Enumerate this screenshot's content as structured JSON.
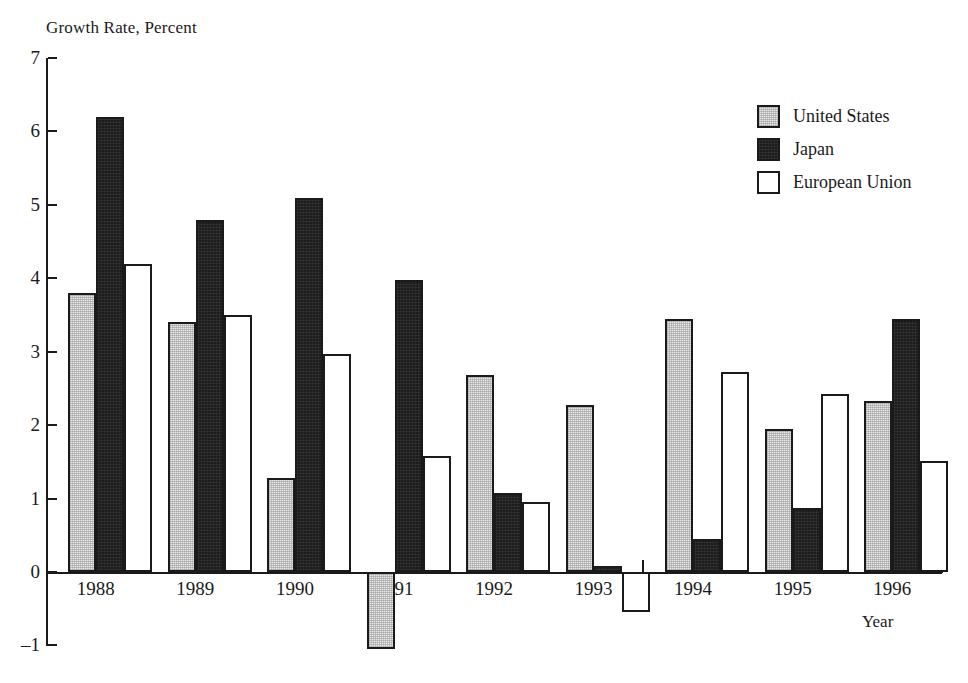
{
  "chart_data": {
    "type": "bar",
    "title": "",
    "ylabel": "Growth Rate, Percent",
    "xlabel": "Year",
    "categories": [
      "1988",
      "1989",
      "1990",
      "1991",
      "1992",
      "1993",
      "1994",
      "1995",
      "1996"
    ],
    "series": [
      {
        "name": "United States",
        "color": "#e8e8e8",
        "values": [
          3.8,
          3.4,
          1.28,
          -1.05,
          2.68,
          2.27,
          3.45,
          1.95,
          2.33
        ]
      },
      {
        "name": "Japan",
        "color": "#1c1c1c",
        "values": [
          6.2,
          4.8,
          5.1,
          3.98,
          1.07,
          0.08,
          0.45,
          0.87,
          3.45
        ]
      },
      {
        "name": "European Union",
        "color": "#ffffff",
        "values": [
          4.2,
          3.5,
          2.97,
          1.58,
          0.95,
          -0.55,
          2.73,
          2.42,
          1.51
        ]
      }
    ],
    "ylim": [
      -1,
      7
    ],
    "yticks": [
      7,
      6,
      5,
      4,
      3,
      2,
      1,
      0,
      -1
    ],
    "ytick_labels": [
      "7",
      "6",
      "5",
      "4",
      "3",
      "2",
      "1",
      "0",
      "–1"
    ],
    "grid": false,
    "legend_position": "top-right",
    "axis_color": "#1a1a1a"
  },
  "legend": {
    "items": [
      {
        "label": "United States",
        "swatch": "us"
      },
      {
        "label": "Japan",
        "swatch": "jp"
      },
      {
        "label": "European Union",
        "swatch": "eu"
      }
    ]
  }
}
